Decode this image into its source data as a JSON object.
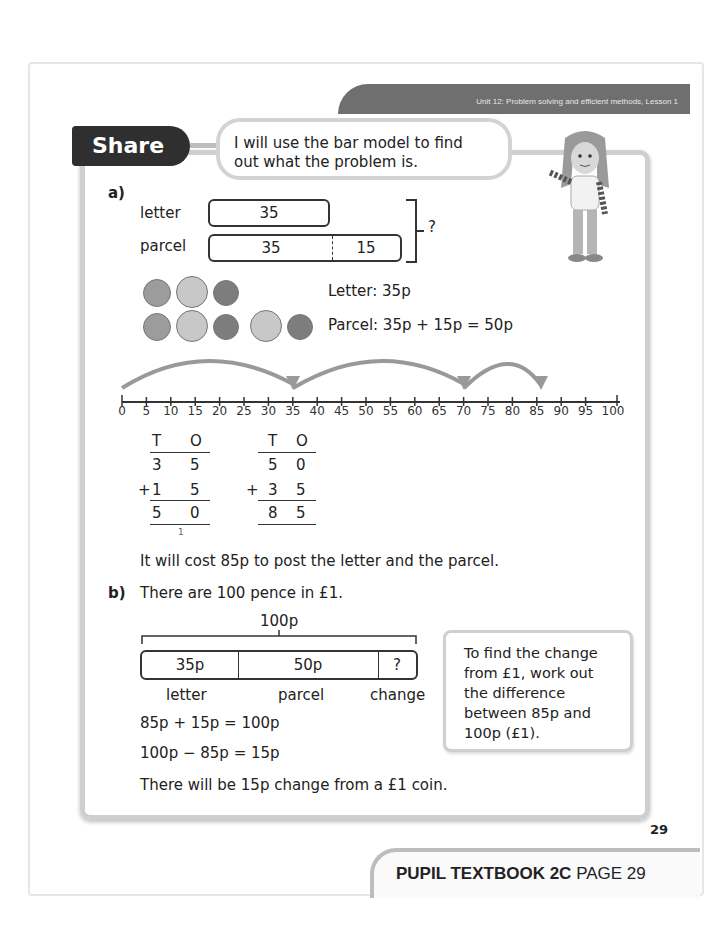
{
  "header": {
    "unit_banner": "Unit 12: Problem solving and efficient methods, Lesson 1"
  },
  "share_tab": {
    "label": "Share"
  },
  "speech_bubble": {
    "line1": "I will use the bar model to find",
    "line2": "out what the problem is."
  },
  "part_a": {
    "label": "a)",
    "bar_model": {
      "rows": [
        {
          "label": "letter",
          "segments": [
            "35"
          ]
        },
        {
          "label": "parcel",
          "segments": [
            "35",
            "15"
          ]
        }
      ],
      "total_label": "?"
    },
    "coins": {
      "letter_text": "Letter: 35p",
      "parcel_text": "Parcel: 35p + 15p = 50p"
    },
    "number_line": {
      "ticks": [
        "0",
        "5",
        "10",
        "15",
        "20",
        "25",
        "30",
        "35",
        "40",
        "45",
        "50",
        "55",
        "60",
        "65",
        "70",
        "75",
        "80",
        "85",
        "90",
        "95",
        "100"
      ],
      "jumps": [
        [
          0,
          35
        ],
        [
          35,
          70
        ],
        [
          70,
          85
        ]
      ]
    },
    "column_additions": [
      {
        "headers": [
          "T",
          "O"
        ],
        "top": [
          "3",
          "5"
        ],
        "plus": "+",
        "bottom": [
          "1",
          "5"
        ],
        "result": [
          "5",
          "0"
        ],
        "carry": "1"
      },
      {
        "headers": [
          "T",
          "O"
        ],
        "top": [
          "5",
          "0"
        ],
        "plus": "+",
        "bottom": [
          "3",
          "5"
        ],
        "result": [
          "8",
          "5"
        ]
      }
    ],
    "conclusion": "It will cost 85p to post the letter and the parcel."
  },
  "part_b": {
    "label": "b)",
    "intro": "There are 100 pence in £1.",
    "bar_model": {
      "total": "100p",
      "segments": [
        {
          "value": "35p",
          "label": "letter"
        },
        {
          "value": "50p",
          "label": "parcel"
        },
        {
          "value": "?",
          "label": "change"
        }
      ]
    },
    "equation1": "85p + 15p = 100p",
    "equation2": "100p − 85p = 15p",
    "conclusion": "There will be 15p change from a £1 coin.",
    "note": [
      "To find the change",
      "from £1, work out",
      "the difference",
      "between 85p and",
      "100p (£1)."
    ]
  },
  "page_number": "29",
  "footer": {
    "book": "PUPIL TEXTBOOK 2C",
    "page": "PAGE 29"
  }
}
